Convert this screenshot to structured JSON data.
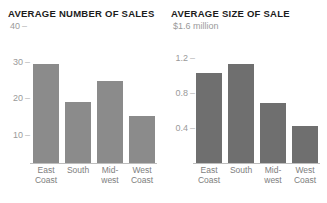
{
  "chart_data": [
    {
      "id": "average-number-of-sales",
      "type": "bar",
      "title": "AVERAGE NUMBER OF SALES",
      "xlabel": "",
      "ylabel": "",
      "ylim": [
        0,
        40
      ],
      "grid": false,
      "legend": "none",
      "axis_top_label": "40",
      "axis_top_dash": "–",
      "yticks": [
        {
          "value": 30,
          "label": "30",
          "dash": "–"
        },
        {
          "value": 20,
          "label": "20",
          "dash": "–"
        },
        {
          "value": 10,
          "label": "10",
          "dash": "–"
        }
      ],
      "categories": [
        "East Coast",
        "South",
        "Midwest",
        "West Coast"
      ],
      "category_lines": [
        {
          "line1": "East",
          "line2": "Coast"
        },
        {
          "line1": "South",
          "line2": ""
        },
        {
          "line1": "Mid-",
          "line2": "west"
        },
        {
          "line1": "West",
          "line2": "Coast"
        }
      ],
      "values": [
        34,
        21,
        28,
        16
      ],
      "bar_color": "#8b8b8b"
    },
    {
      "id": "average-size-of-sale",
      "type": "bar",
      "title": "AVERAGE SIZE OF SALE",
      "xlabel": "",
      "ylabel": "",
      "ylim": [
        0,
        1.6
      ],
      "grid": false,
      "legend": "none",
      "axis_top_label": "$1.6 million",
      "axis_top_dash": "",
      "yticks": [
        {
          "value": 1.2,
          "label": "1.2",
          "dash": "–"
        },
        {
          "value": 0.8,
          "label": "0.8",
          "dash": "–"
        },
        {
          "value": 0.4,
          "label": "0.4",
          "dash": "–"
        }
      ],
      "categories": [
        "East Coast",
        "South",
        "Midwest",
        "West Coast"
      ],
      "category_lines": [
        {
          "line1": "East",
          "line2": "Coast"
        },
        {
          "line1": "South",
          "line2": ""
        },
        {
          "line1": "Mid-",
          "line2": "west"
        },
        {
          "line1": "West",
          "line2": "Coast"
        }
      ],
      "values": [
        1.23,
        1.35,
        0.82,
        0.51
      ],
      "bar_color": "#6f6f6f"
    }
  ]
}
